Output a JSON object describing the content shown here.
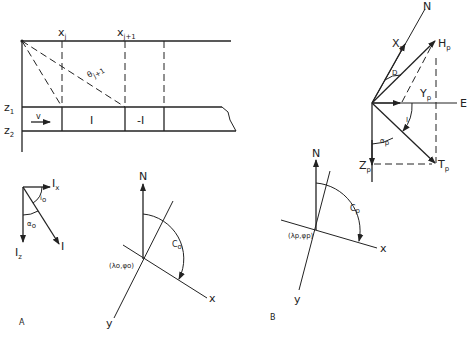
{
  "figure": {
    "panel_a_label": "A",
    "panel_b_label": "B",
    "profile": {
      "x_j": "x",
      "x_j_sub": "j",
      "x_j1": "x",
      "x_j1_sub": "j+1",
      "theta": "θ",
      "theta_sub": "j+1",
      "z1": "z",
      "z1_sub": "1",
      "z2": "z",
      "z2_sub": "2",
      "v": "v",
      "block1": "I",
      "block2": "-I"
    },
    "magnetization": {
      "Ix": "I",
      "Ix_sub": "x",
      "Iz": "I",
      "Iz_sub": "z",
      "I": "I",
      "io": "i",
      "io_sub": "o",
      "alpha": "α",
      "alpha_sub": "o"
    },
    "map_a": {
      "north": "N",
      "x": "x",
      "y": "y",
      "C": "C",
      "C_sub": "o",
      "origin": "(λo,φo)"
    },
    "field": {
      "north": "N",
      "east": "E",
      "Xp": "X",
      "Xp_sub": "p",
      "Yp": "Y",
      "Yp_sub": "p",
      "Zp": "Z",
      "Zp_sub": "p",
      "Hp": "H",
      "Hp_sub": "p",
      "Tp": "T",
      "Tp_sub": "p",
      "D": "D",
      "I": "I",
      "alpha": "α",
      "alpha_sub": "p"
    },
    "map_b": {
      "north": "N",
      "x": "x",
      "y": "y",
      "C": "C",
      "C_sub": "p",
      "origin": "(λp,φp)"
    }
  }
}
